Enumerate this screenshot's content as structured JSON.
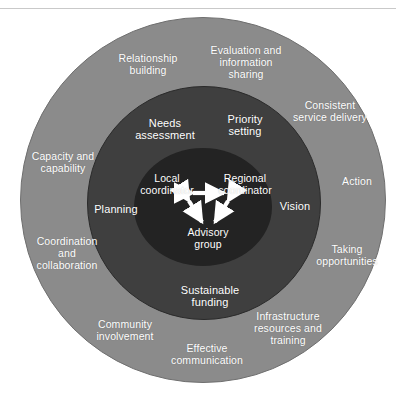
{
  "figure": {
    "background_color": "#ffffff",
    "rule_color": "#c9c9c9"
  },
  "rings": {
    "outer": {
      "name": "outer-ring",
      "color": "#8b8b8b",
      "labels": [
        {
          "text": "Relationship\nbuilding",
          "x": 148,
          "y": 65
        },
        {
          "text": "Evaluation and\ninformation\nsharing",
          "x": 246,
          "y": 63
        },
        {
          "text": "Consistent\nservice delivery",
          "x": 330,
          "y": 112
        },
        {
          "text": "Capacity and\ncapability",
          "x": 63,
          "y": 163
        },
        {
          "text": "Action",
          "x": 357,
          "y": 182
        },
        {
          "text": "Coordination\nand\ncollaboration",
          "x": 67,
          "y": 254
        },
        {
          "text": "Taking\nopportunities",
          "x": 347,
          "y": 256
        },
        {
          "text": "Community\ninvolvement",
          "x": 125,
          "y": 331
        },
        {
          "text": "Infrastructure\nresources and\ntraining",
          "x": 288,
          "y": 329
        },
        {
          "text": "Effective\ncommunication",
          "x": 207,
          "y": 355
        }
      ]
    },
    "middle": {
      "name": "middle-ring",
      "color": "#3f3f3f",
      "labels": [
        {
          "text": "Needs\nassessment",
          "x": 165,
          "y": 129
        },
        {
          "text": "Priority\nsetting",
          "x": 245,
          "y": 125
        },
        {
          "text": "Planning",
          "x": 116,
          "y": 209
        },
        {
          "text": "Vision",
          "x": 295,
          "y": 206
        },
        {
          "text": "Sustainable\nfunding",
          "x": 210,
          "y": 296
        }
      ]
    },
    "core": {
      "name": "core-circle",
      "color": "#232323",
      "labels": [
        {
          "text": "Local\ncoordinator",
          "x": 167,
          "y": 185
        },
        {
          "text": "Regional\ncoordinator",
          "x": 245,
          "y": 185
        },
        {
          "text": "Advisory\ngroup",
          "x": 208,
          "y": 239
        }
      ],
      "connectors": [
        {
          "name": "local-to-regional-arrow",
          "from": "Local coordinator",
          "to": "Regional coordinator",
          "style": "double-headed"
        },
        {
          "name": "local-to-advisory-arrow",
          "from": "Local coordinator",
          "to": "Advisory group",
          "style": "double-headed"
        },
        {
          "name": "regional-to-advisory-arrow",
          "from": "Regional coordinator",
          "to": "Advisory group",
          "style": "double-headed"
        }
      ],
      "connector_color": "#ffffff"
    }
  }
}
